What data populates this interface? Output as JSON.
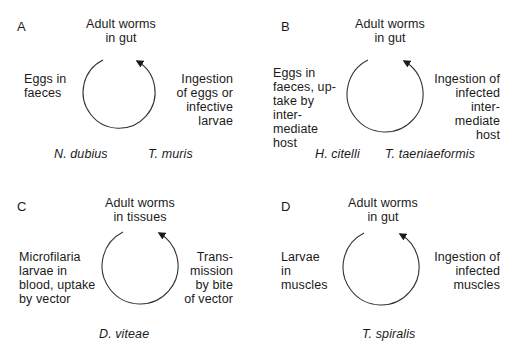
{
  "panels": [
    {
      "label": "A",
      "top": "Adult worms\nin gut",
      "left": "Eggs in\nfaeces",
      "right": "Ingestion\nof eggs or\ninfective\nlarvae",
      "species": [
        "N. dubius",
        "T. muris"
      ]
    },
    {
      "label": "B",
      "top": "Adult worms\nin gut",
      "left": "Eggs in\nfaeces, up-\ntake by\ninter-\nmediate\nhost",
      "right": "Ingestion of\ninfected\ninter-\nmediate\nhost",
      "species": [
        "H. citelli",
        "T. taeniaeformis"
      ]
    },
    {
      "label": "C",
      "top": "Adult worms\nin tissues",
      "left": "Microfilaria\nlarvae in\nblood, uptake\nby vector",
      "right": "Trans-\nmission\nby bite\nof vector",
      "species": [
        "D. viteae"
      ]
    },
    {
      "label": "D",
      "top": "Adult worms\nin gut",
      "left": "Larvae\nin\nmuscles",
      "right": "Ingestion of\ninfected\nmuscles",
      "species": [
        "T. spiralis"
      ]
    }
  ],
  "colors": {
    "ink": "#1a1a1a",
    "background": "#ffffff"
  }
}
